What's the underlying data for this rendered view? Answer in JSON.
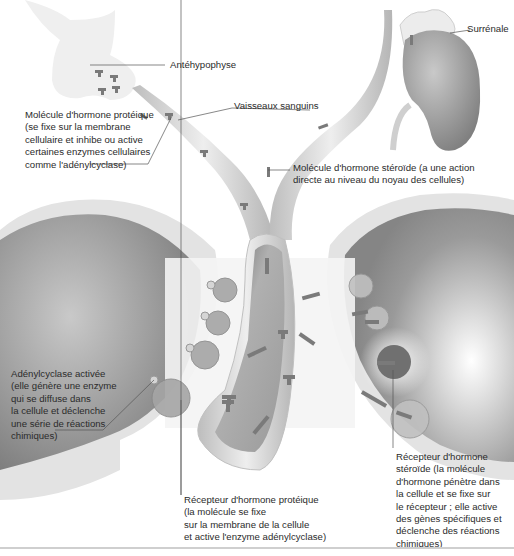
{
  "diagram": {
    "type": "biology-illustration",
    "organs": [
      "Antéhypophyse",
      "Surrénale",
      "Vaisseaux sanguins"
    ],
    "colors": {
      "background": "#ffffff",
      "vessel": "#d8d8d8",
      "cell_interior": "#9a9a9a",
      "molecule": "#6e6e6e",
      "text": "#2b2b2b"
    }
  },
  "labels": {
    "antehypophyse": "Antéhypophyse",
    "surrenale": "Surrénale",
    "vaisseaux": "Vaisseaux sanguins",
    "hormone_proteique": "Molécule d'hormone protéique\n(se fixe sur la membrane\ncellulaire et inhibe ou active\ncertaines enzymes cellulaires\ncomme l'adénylcyclase)",
    "hormone_steroide": "Molécule d'hormone stéroïde (a une action\ndirecte au niveau du noyau des cellules)",
    "adenylcyclase": "Adénylcyclase activée\n(elle génère une enzyme\nqui se diffuse dans\nla cellule et déclenche\nune série de réactions\nchimiques)",
    "recepteur_proteique": "Récepteur d'hormone protéique\n(la molécule se fixe\nsur la membrane de la cellule\net active l'enzyme adénylcyclase)",
    "recepteur_steroide": "Récepteur d'hormone\nstéroïde (la molécule\nd'hormone pénètre dans\nla cellule et se fixe sur\nle récepteur ; elle active\ndes gènes spécifiques et\ndéclenche des réactions\nchimiques)"
  }
}
